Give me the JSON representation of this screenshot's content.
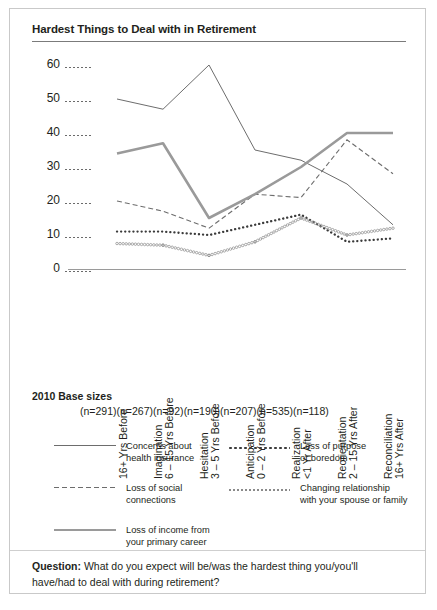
{
  "title": "Hardest Things to Deal with in Retirement",
  "base": {
    "label": "2010 Base sizes",
    "values": [
      "(n=291)",
      "(n=267)",
      "(n=92)",
      "(n=190)",
      "(n=207)",
      "(n=535)",
      "(n=118)"
    ]
  },
  "legend": [
    {
      "style": "solid",
      "line1": "Concerns about",
      "line2": "health insurance"
    },
    {
      "style": "dashed",
      "line1": "Loss of social",
      "line2": "connections"
    },
    {
      "style": "thick",
      "line1": "Loss of income from",
      "line2": "your primary career"
    },
    {
      "style": "dotted",
      "line1": "Loss of purpose",
      "line2": "or boredom"
    },
    {
      "style": "circles",
      "line1": "Changing relationship",
      "line2": "with your spouse or family"
    }
  ],
  "question": {
    "label": "Question:",
    "text": " What do you expect will be/was the hardest thing you/you'll have/had to deal with during retirement?"
  },
  "chart_data": {
    "type": "line",
    "title": "Hardest Things to Deal with in Retirement",
    "xlabel": "",
    "ylabel": "",
    "ylim": [
      0,
      60
    ],
    "yticks": [
      0,
      10,
      20,
      30,
      40,
      50,
      60
    ],
    "grid": false,
    "legend_position": "bottom",
    "categories": [
      "16+ Yrs Before",
      "Imagination 6 – 15 Yrs Before",
      "Hesitation 3 – 5 Yrs Before",
      "Anticipation 0 – 2 Yrs Before",
      "Realization <1 Yr After",
      "Reorientation 2 – 15 Yrs After",
      "Reconciliation 16+ Yrs After"
    ],
    "category_lines": [
      [
        "",
        "16+ Yrs Before"
      ],
      [
        "Imagination",
        "6 – 15 Yrs Before"
      ],
      [
        "Hesitation",
        "3 – 5 Yrs Before"
      ],
      [
        "Anticipation",
        "0 – 2 Yrs Before"
      ],
      [
        "Realization",
        "<1 Yr After"
      ],
      [
        "Reorientation",
        "2 – 15 Yrs After"
      ],
      [
        "Reconciliation",
        "16+ Yrs After"
      ]
    ],
    "series": [
      {
        "name": "Concerns about health insurance",
        "style": "solid",
        "color": "#6d6d6d",
        "values": [
          50,
          47,
          60,
          35,
          32,
          25,
          13
        ]
      },
      {
        "name": "Loss of social connections",
        "style": "dashed",
        "color": "#6d6d6d",
        "values": [
          20,
          17,
          12,
          22,
          21,
          38,
          28
        ]
      },
      {
        "name": "Loss of income from your primary career",
        "style": "thick",
        "color": "#9a9a9a",
        "values": [
          34,
          37,
          15,
          22,
          30,
          40,
          40
        ]
      },
      {
        "name": "Loss of purpose or boredom",
        "style": "dotted",
        "color": "#3b3b3b",
        "values": [
          11,
          11,
          10,
          13,
          16,
          8,
          9
        ]
      },
      {
        "name": "Changing relationship with your spouse or family",
        "style": "circles",
        "color": "#8a8a8a",
        "values": [
          7.5,
          7,
          4,
          8,
          15,
          10,
          12
        ]
      }
    ]
  }
}
